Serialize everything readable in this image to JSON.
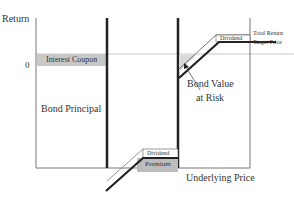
{
  "diagram": {
    "y_axis_label": "Return",
    "zero_label": "0",
    "x_axis_label": "Underlying Price",
    "regions": {
      "interest_coupon": "Interest Coupon",
      "bond_principal": "Bond Principal",
      "bond_value_at_risk_line1": "Bond Value",
      "bond_value_at_risk_line2": "at Risk",
      "dividend_top": "Dividend",
      "dividend_bottom": "Dividend",
      "premium": "Premium"
    },
    "annotations": {
      "total_return": "Total Return",
      "target_price": "Target Price"
    },
    "colors": {
      "shade": "#c8c8c8",
      "line": "#222222",
      "thin_line": "#888888"
    }
  }
}
